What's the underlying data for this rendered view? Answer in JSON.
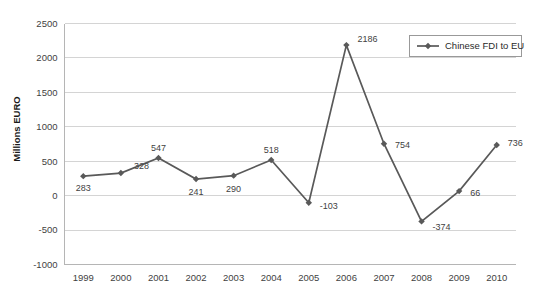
{
  "chart_data": {
    "type": "line",
    "title": "",
    "xlabel": "",
    "ylabel": "Millions EURO",
    "ylim": [
      -1000,
      2500
    ],
    "ytick_step": 500,
    "yticks": [
      "2500",
      "2000",
      "1500",
      "1000",
      "500",
      "0",
      "-500",
      "-1000"
    ],
    "categories": [
      "1999",
      "2000",
      "2001",
      "2002",
      "2003",
      "2004",
      "2005",
      "2006",
      "2007",
      "2008",
      "2009",
      "2010"
    ],
    "series": [
      {
        "name": "Chinese FDI to EU",
        "values": [
          283,
          328,
          547,
          241,
          290,
          518,
          -103,
          2186,
          754,
          -374,
          66,
          736
        ],
        "color": "#595959",
        "marker": "diamond"
      }
    ],
    "data_labels": [
      "283",
      "328",
      "547",
      "241",
      "290",
      "518",
      "-103",
      "2186",
      "754",
      "-374",
      "66",
      "736"
    ],
    "grid": {
      "horizontal": true,
      "vertical": false,
      "color": "#d4d4d4"
    },
    "legend": {
      "position": "top-right",
      "entries": [
        "Chinese FDI to EU"
      ],
      "bordered": true
    }
  },
  "colors": {
    "series": "#595959",
    "grid": "#d4d4d4",
    "axis": "#b5b5b5",
    "text": "#3f3f3f",
    "background": "#ffffff"
  }
}
